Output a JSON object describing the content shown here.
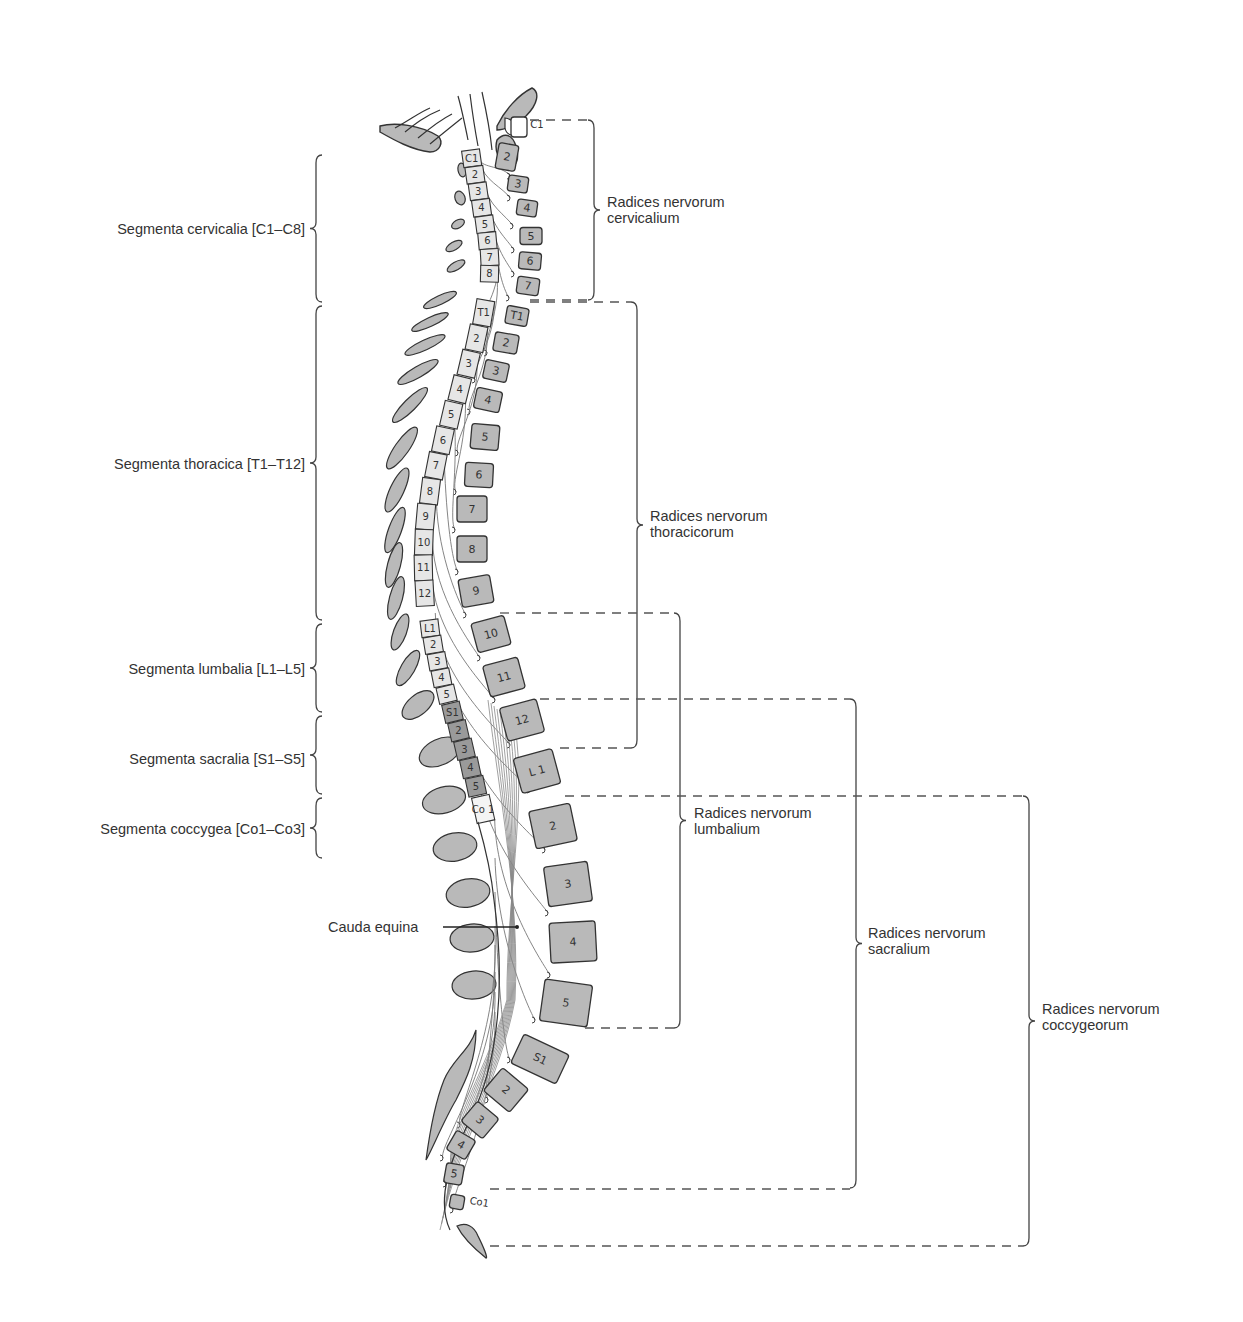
{
  "diagram": {
    "colors": {
      "bone_fill": "#b9b9b9",
      "outline": "#333333",
      "segment_light": "#e6e6e6",
      "segment_dark": "#9a9a9a",
      "bracket": "#444444",
      "dash": "#555555"
    }
  },
  "left_labels": [
    {
      "id": "cervical",
      "text": "Segmenta cervicalia [C1–C8]"
    },
    {
      "id": "thoracic",
      "text": "Segmenta thoracica [T1–T12]"
    },
    {
      "id": "lumbar",
      "text": "Segmenta lumbalia [L1–L5]"
    },
    {
      "id": "sacral",
      "text": "Segmenta sacralia [S1–S5]"
    },
    {
      "id": "coccygeal",
      "text": "Segmenta coccygea [Co1–Co3]"
    }
  ],
  "right_labels": [
    {
      "id": "cervical",
      "line1": "Radices nervorum",
      "line2": "cervicalium"
    },
    {
      "id": "thoracic",
      "line1": "Radices nervorum",
      "line2": "thoracicorum"
    },
    {
      "id": "lumbar",
      "line1": "Radices nervorum",
      "line2": "lumbalium"
    },
    {
      "id": "sacral",
      "line1": "Radices nervorum",
      "line2": "sacralium"
    },
    {
      "id": "coccygeal",
      "line1": "Radices nervorum",
      "line2": "coccygeorum"
    }
  ],
  "pointer_labels": [
    {
      "id": "cauda-equina",
      "text": "Cauda equina"
    }
  ],
  "cord_segments": {
    "cervical": [
      "C1",
      "2",
      "3",
      "4",
      "5",
      "6",
      "7",
      "8"
    ],
    "thoracic": [
      "T1",
      "2",
      "3",
      "4",
      "5",
      "6",
      "7",
      "8",
      "9",
      "10",
      "11",
      "12"
    ],
    "lumbar": [
      "L1",
      "2",
      "3",
      "4",
      "5"
    ],
    "sacral": [
      "S1",
      "2",
      "3",
      "4",
      "5"
    ],
    "coccygeal": [
      "Co 1"
    ]
  },
  "vertebrae": {
    "cervical": [
      "C1",
      "2",
      "3",
      "4",
      "5",
      "6",
      "7"
    ],
    "thoracic": [
      "T1",
      "2",
      "3",
      "4",
      "5",
      "6",
      "7",
      "8",
      "9",
      "10",
      "11",
      "12"
    ],
    "lumbar": [
      "L 1",
      "2",
      "3",
      "4",
      "5"
    ],
    "sacral": [
      "S1",
      "2",
      "3",
      "4",
      "5"
    ],
    "coccygeal": [
      "Co1"
    ]
  }
}
